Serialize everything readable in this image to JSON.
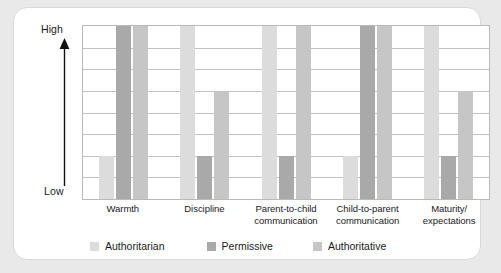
{
  "figure": {
    "background_color": "#e9e9e9",
    "card_color": "#ffffff"
  },
  "axis": {
    "high_label": "High",
    "low_label": "Low",
    "arrow_icon": "up-arrow-icon"
  },
  "legend": {
    "items": [
      {
        "label": "Authoritarian",
        "color": "#dcdcdc"
      },
      {
        "label": "Permissive",
        "color": "#a9a9a9"
      },
      {
        "label": "Authoritative",
        "color": "#c6c6c6"
      }
    ]
  },
  "chart_data": {
    "type": "bar",
    "title": "",
    "subtitle": "",
    "xlabel": "",
    "ylabel": "",
    "ylim": [
      0,
      8
    ],
    "ytick_labels": [
      "Low",
      "High"
    ],
    "grid": true,
    "grid_rows": 8,
    "legend_position": "bottom",
    "categories": [
      "Warmth",
      "Discipline",
      "Parent-to-child\ncommunication",
      "Child-to-parent\ncommunication",
      "Maturity/\nexpectations"
    ],
    "series": [
      {
        "name": "Authoritarian",
        "color": "#dcdcdc",
        "values": [
          2,
          8,
          8,
          2,
          8
        ]
      },
      {
        "name": "Permissive",
        "color": "#a9a9a9",
        "values": [
          8,
          2,
          2,
          8,
          2
        ]
      },
      {
        "name": "Authoritative",
        "color": "#c6c6c6",
        "values": [
          8,
          5,
          8,
          8,
          5
        ]
      }
    ]
  }
}
